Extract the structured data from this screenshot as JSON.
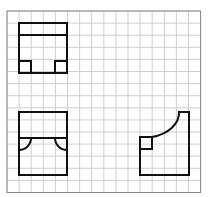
{
  "grid": {
    "left": 7,
    "top": 11,
    "cell": 12.1,
    "cols": 16,
    "rows": 15,
    "line_color": "#c4c4c4",
    "border_color": "#888888"
  },
  "stroke_color": "#111111",
  "figures": [
    {
      "name": "top-view-front-figure",
      "description": "Rectangle with top band and two small corner squares at bottom",
      "outer": {
        "x": 19,
        "y": 23,
        "w": 48,
        "h": 50
      },
      "band_y": 35,
      "squares": [
        {
          "x": 19,
          "y": 61,
          "w": 12,
          "h": 12
        },
        {
          "x": 55,
          "y": 61,
          "w": 12,
          "h": 12
        }
      ]
    },
    {
      "name": "front-view-figure",
      "description": "Rectangle with horizontal middle line and two quarter-circle arcs",
      "outer": {
        "x": 19,
        "y": 112,
        "w": 48,
        "h": 63
      },
      "mid_y": 138,
      "arcs": [
        {
          "cx": 19,
          "cy": 138,
          "r": 12,
          "side": "left"
        },
        {
          "cx": 67,
          "cy": 138,
          "r": 12,
          "side": "right"
        }
      ]
    },
    {
      "name": "side-view-figure",
      "description": "Shape with a concave quarter-arc top-left and a small square",
      "points": {
        "x0": 140,
        "x1": 152,
        "x2": 189,
        "y0": 112,
        "y1": 137,
        "y2": 175
      },
      "square": {
        "x": 140,
        "y": 137,
        "w": 12,
        "h": 12
      }
    }
  ]
}
